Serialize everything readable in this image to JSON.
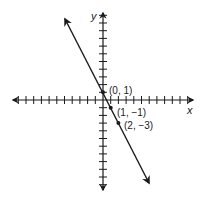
{
  "chart_data": {
    "type": "line",
    "title": "",
    "xlabel": "x",
    "ylabel": "y",
    "equation": "y = -2x + 1",
    "slope": -2,
    "intercept": 1,
    "grid": false,
    "axis_ticks_each_side": 11,
    "xlim": [
      -11,
      11
    ],
    "ylim": [
      -11,
      11
    ],
    "points": [
      {
        "x": 0,
        "y": 1,
        "label": "(0, 1)"
      },
      {
        "x": 1,
        "y": -1,
        "label": "(1, −1)"
      },
      {
        "x": 2,
        "y": -3,
        "label": "(2, −3)"
      }
    ],
    "line_endpoints": [
      {
        "x": -4.9,
        "y": 10.8
      },
      {
        "x": 6.0,
        "y": -10.8
      }
    ]
  },
  "labels": {
    "x_axis": "x",
    "y_axis": "y",
    "p0": "(0, 1)",
    "p1": "(1, −1)",
    "p2": "(2, −3)"
  },
  "colors": {
    "ink": "#1a1a1a",
    "background": "#ffffff"
  }
}
